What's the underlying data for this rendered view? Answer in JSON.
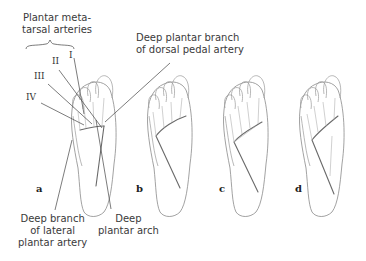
{
  "labels": {
    "plantar_metatarsal": [
      "Plantar meta-",
      "tarsal arteries"
    ],
    "deep_plantar_branch": [
      "Deep plantar branch",
      "of dorsal pedal artery"
    ],
    "deep_branch_lateral": [
      "Deep branch",
      "of lateral",
      "plantar artery"
    ],
    "deep_plantar_arch": [
      "Deep",
      "plantar arch"
    ]
  },
  "roman_numerals": [
    "I",
    "II",
    "III",
    "IV"
  ],
  "panels": [
    "a",
    "b",
    "c",
    "d"
  ],
  "colors": {
    "outline": "#8a8a8a",
    "artery": "#6a6a6a",
    "leader_line": "#444444",
    "text": "#3a3a3a"
  }
}
